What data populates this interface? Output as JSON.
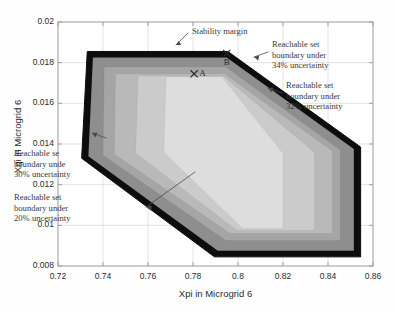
{
  "figure": {
    "type": "figure",
    "background": "#ffffff"
  },
  "axes": {
    "x": {
      "label": "Xpi in Microgrid 6",
      "min": 0.72,
      "max": 0.86,
      "step": 0.02,
      "ticks": [
        "0.72",
        "0.74",
        "0.76",
        "0.78",
        "0.8",
        "0.82",
        "0.84",
        "0.86"
      ]
    },
    "y": {
      "label": "Xqi in Microgrid 6",
      "min": 0.008,
      "max": 0.02,
      "step": 0.002,
      "ticks": [
        "0.008",
        "0.01",
        "0.012",
        "0.014",
        "0.016",
        "0.018",
        "0.02"
      ]
    },
    "grid": true,
    "box": true
  },
  "annotations": {
    "stability_margin": "Stability margin",
    "band34": "Reachable set\nboundary under\n34% uncertainty",
    "band34_lines": [
      "Reachable set",
      "boundary under",
      "34% uncertainty"
    ],
    "band32_lines": [
      "Reachable set",
      "boundary under",
      "32% uncertainty"
    ],
    "band30_lines": [
      "Reachable se",
      "boundary unde",
      "30% uncertainty"
    ],
    "band20_lines": [
      "Reachable set",
      "boundary under",
      "20% uncertainty"
    ],
    "point_a": "A",
    "point_b": "B"
  },
  "colors": {
    "stability_margin": "#0d0d0d",
    "band34": "#8e8e8e",
    "band32": "#a5a5a5",
    "band30": "#b9b9b9",
    "band20": "#cbcbcb",
    "core": "#dddddd",
    "grid": "#d7d7d7",
    "axis": "#9a9a9a",
    "text": "#2b2b2b"
  },
  "chart_data": {
    "type": "area",
    "title": "",
    "xlabel": "Xpi in Microgrid 6",
    "ylabel": "Xqi in Microgrid 6",
    "xlim": [
      0.72,
      0.86
    ],
    "ylim": [
      0.008,
      0.02
    ],
    "xticks": [
      0.72,
      0.74,
      0.76,
      0.78,
      0.8,
      0.82,
      0.84,
      0.86
    ],
    "yticks": [
      0.008,
      0.01,
      0.012,
      0.014,
      0.016,
      0.018,
      0.02
    ],
    "grid": true,
    "legend": "none",
    "series": [
      {
        "name": "Stability margin",
        "fill": "#0d0d0d",
        "level_percent": null,
        "polygon": [
          [
            0.733,
            0.01855
          ],
          [
            0.7955,
            0.01855
          ],
          [
            0.8545,
            0.01385
          ],
          [
            0.8545,
            0.00845
          ],
          [
            0.7895,
            0.00845
          ],
          [
            0.7305,
            0.0133
          ]
        ]
      },
      {
        "name": "Reachable set boundary under 34% uncertainty",
        "fill": "#8e8e8e",
        "level_percent": 34,
        "polygon": [
          [
            0.7355,
            0.01825
          ],
          [
            0.795,
            0.01825
          ],
          [
            0.8515,
            0.01375
          ],
          [
            0.8515,
            0.00875
          ],
          [
            0.791,
            0.00875
          ],
          [
            0.7335,
            0.0134
          ]
        ]
      },
      {
        "name": "Reachable set boundary under 32% uncertainty",
        "fill": "#a5a5a5",
        "level_percent": 32,
        "polygon": [
          [
            0.7405,
            0.0178
          ],
          [
            0.7945,
            0.0178
          ],
          [
            0.8455,
            0.0137
          ],
          [
            0.8455,
            0.00925
          ],
          [
            0.7945,
            0.00925
          ],
          [
            0.74,
            0.01345
          ]
        ]
      },
      {
        "name": "Reachable set boundary under 30% uncertainty",
        "fill": "#b9b9b9",
        "level_percent": 30,
        "polygon": [
          [
            0.7455,
            0.01745
          ],
          [
            0.794,
            0.01745
          ],
          [
            0.842,
            0.01365
          ],
          [
            0.842,
            0.0096
          ],
          [
            0.7965,
            0.0096
          ],
          [
            0.745,
            0.0135
          ]
        ]
      },
      {
        "name": "Reachable set boundary under 20% uncertainty",
        "fill": "#cbcbcb",
        "level_percent": 20,
        "polygon": [
          [
            0.7555,
            0.01735
          ],
          [
            0.7935,
            0.01735
          ],
          [
            0.834,
            0.0136
          ],
          [
            0.834,
            0.00975
          ],
          [
            0.7995,
            0.00975
          ],
          [
            0.7545,
            0.01355
          ]
        ]
      },
      {
        "name": "Innermost reachable set",
        "fill": "#dddddd",
        "level_percent": null,
        "polygon": [
          [
            0.768,
            0.0173
          ],
          [
            0.793,
            0.0173
          ],
          [
            0.82,
            0.01355
          ],
          [
            0.82,
            0.00985
          ],
          [
            0.802,
            0.00985
          ],
          [
            0.767,
            0.0136
          ]
        ]
      }
    ],
    "points": [
      {
        "label": "A",
        "x": 0.7805,
        "y": 0.01745,
        "marker": "x"
      },
      {
        "label": "B",
        "x": 0.795,
        "y": 0.01845,
        "marker": "x"
      }
    ]
  }
}
